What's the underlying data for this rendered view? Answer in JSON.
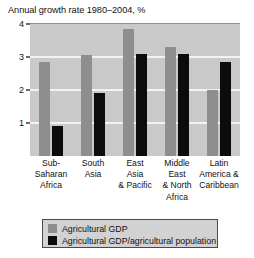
{
  "chart_data": {
    "type": "bar",
    "title": "Annual growth rate 1980–2004, %",
    "xlabel": "",
    "ylabel": "",
    "ylim": [
      0,
      4
    ],
    "yticks": [
      "0",
      "1",
      "2",
      "3",
      "4"
    ],
    "ytick_values": [
      0,
      1,
      2,
      3,
      4
    ],
    "grid": true,
    "legend_position": "bottom",
    "categories": [
      "Sub-Saharan Africa",
      "South Asia",
      "East Asia & Pacific",
      "Middle East & North Africa",
      "Latin America & Caribbean"
    ],
    "category_lines": [
      [
        "Sub-",
        "Saharan",
        "Africa"
      ],
      [
        "South",
        "Asia"
      ],
      [
        "East",
        "Asia",
        "& Pacific"
      ],
      [
        "Middle",
        "East",
        "& North",
        "Africa"
      ],
      [
        "Latin",
        "America &",
        "Caribbean"
      ]
    ],
    "series": [
      {
        "name": "Agricultural GDP",
        "color": "#8e8e8e",
        "values": [
          2.85,
          3.05,
          3.85,
          3.3,
          2.0
        ]
      },
      {
        "name": "Agricultural GDP/agricultural population",
        "color": "#0c0c0c",
        "values": [
          0.9,
          1.92,
          3.1,
          3.1,
          2.85
        ]
      }
    ]
  },
  "legend": {
    "entries": [
      {
        "label": "Agricultural GDP",
        "swatch": "gdp"
      },
      {
        "label": "Agricultural GDP/agricultural population",
        "swatch": "per-capita"
      }
    ]
  },
  "colors": {
    "plot_background": "#c9c9c9",
    "gridline": "#f2f2f2",
    "series_gdp": "#8e8e8e",
    "series_per_capita": "#0c0c0c",
    "legend_background": "#d2d2d2",
    "legend_border": "#4a4a4a",
    "text": "#111111"
  }
}
